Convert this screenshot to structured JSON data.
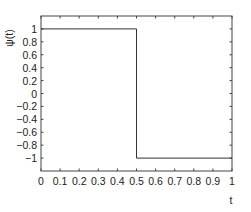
{
  "chart_data": {
    "type": "line",
    "title": "",
    "xlabel": "t",
    "ylabel": "ψ(t)",
    "xlim": [
      0,
      1
    ],
    "ylim": [
      -1.2,
      1.2
    ],
    "grid": false,
    "legend": null,
    "x_ticks": [
      "0",
      "0.1",
      "0.2",
      "0.3",
      "0.4",
      "0.5",
      "0.6",
      "0.7",
      "0.8",
      "0.9",
      "1"
    ],
    "y_ticks": [
      "1",
      "0.8",
      "0.6",
      "0.4",
      "0.2",
      "0",
      "−0.2",
      "−0.4",
      "−0.6",
      "−0.8",
      "−1"
    ],
    "series": [
      {
        "name": "Haar wavelet ψ(t)",
        "x": [
          0,
          0.5,
          0.5,
          1
        ],
        "y": [
          1,
          1,
          -1,
          -1
        ]
      }
    ],
    "colors": {
      "line": "#333333",
      "axes": "#444444"
    }
  }
}
